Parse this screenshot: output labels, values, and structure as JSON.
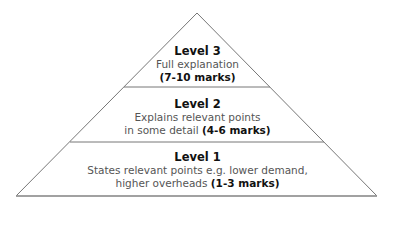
{
  "diagram": {
    "type": "pyramid",
    "levels": [
      {
        "title": "Level 3",
        "line1": "Full explanation",
        "line2_text": "",
        "marks": "(7-10 marks)"
      },
      {
        "title": "Level 2",
        "line1": "Explains relevant points",
        "line2_text": "in some detail ",
        "marks": "(4-6 marks)"
      },
      {
        "title": "Level 1",
        "line1": "States relevant points e.g. lower demand,",
        "line2_text": "higher overheads ",
        "marks": "(1-3 marks)"
      }
    ],
    "colors": {
      "outline": "#777777",
      "text": "#555555",
      "bold": "#111111"
    }
  }
}
